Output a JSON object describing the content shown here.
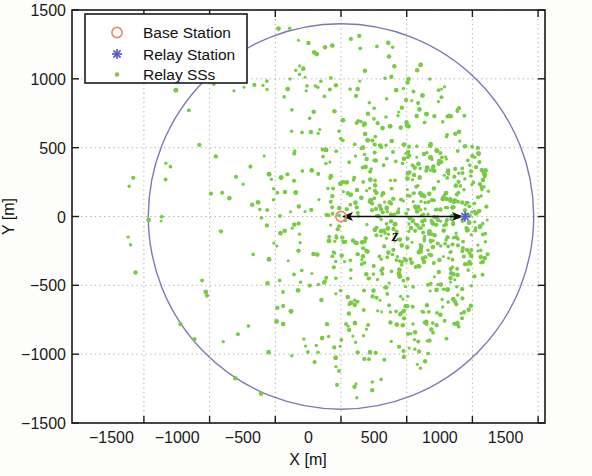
{
  "figure": {
    "background_color": "#fdfdfb",
    "axes_color": "#1a1a1a",
    "grid_color": "#aaaaaa"
  },
  "chart_data": {
    "type": "scatter",
    "title": "",
    "xlabel": "X [m]",
    "ylabel": "Y [m]",
    "xlim": [
      -1800,
      1800
    ],
    "ylim": [
      -1500,
      1500
    ],
    "xticks": [
      -1500,
      -1000,
      -500,
      0,
      500,
      1000,
      1500
    ],
    "xtick_labels": [
      "-1500",
      "-1000",
      "-500",
      "0",
      "500",
      "1000",
      "1500"
    ],
    "yticks": [
      -1500,
      -1000,
      -500,
      0,
      500,
      1000,
      1500
    ],
    "ytick_labels": [
      "-1500",
      "-1000",
      "-500",
      "0",
      "500",
      "1000",
      "1500"
    ],
    "grid": true,
    "grid_style": "dotted",
    "legend_position": "top-left",
    "series": [
      {
        "name": "Base Station",
        "marker": "circle-open",
        "color": "#e08a6e",
        "points": [
          {
            "x": 0,
            "y": 0
          }
        ]
      },
      {
        "name": "Relay Station",
        "marker": "asterisk",
        "color": "#5a5ad0",
        "points": [
          {
            "x": 950,
            "y": 0
          }
        ]
      },
      {
        "name": "Relay SSs",
        "marker": "dot",
        "color": "#77cc44",
        "description": "Several thousand subscriber stations scattered within a circular cell of radius 1400 m centred on the base station; density increases strongly toward the relay station at x = 950 m.",
        "cell_radius": 1400,
        "count_approx": 4000,
        "density_focus": {
          "x": 950,
          "y": 0
        }
      }
    ],
    "annotations": [
      {
        "label": "z",
        "type": "double-headed-arrow",
        "from": {
          "x": 0,
          "y": 0
        },
        "to": {
          "x": 950,
          "y": 0
        },
        "label_position": {
          "x": 480,
          "y": -120
        }
      }
    ],
    "shapes": [
      {
        "type": "circle",
        "name": "cell-boundary",
        "center": {
          "x": 0,
          "y": 0
        },
        "radius": 1400,
        "stroke": "#7b7bb0",
        "fill": "none"
      }
    ]
  },
  "legend": {
    "items": [
      {
        "label": "Base Station",
        "marker": "circle-open",
        "color": "#e08a6e"
      },
      {
        "label": "Relay Station",
        "marker": "asterisk",
        "color": "#5a5ad0"
      },
      {
        "label": "Relay SSs",
        "marker": "dot",
        "color": "#8bc34a"
      }
    ]
  }
}
